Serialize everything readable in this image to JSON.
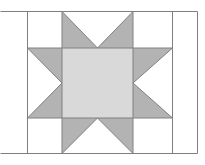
{
  "figure": {
    "canvas": {
      "width": 205,
      "height": 165
    },
    "background_color": "#ffffff"
  },
  "palette": {
    "background_fabric": "#ffffff",
    "star_point_fabric": "#b3b3b3",
    "center_fabric": "#d9d9d9",
    "seam_line": "#808080",
    "outer_frame_line": "#7f7f7f"
  },
  "frame": {
    "name": "block-outer-frame",
    "left": 0.5,
    "top": 11.5,
    "right": 197.5,
    "bottom": 153.5,
    "stroke_width": 1
  },
  "sashing": {
    "name": "vertical-sashing-strips",
    "left_strip_x": 27.5,
    "right_strip_x": 172.5,
    "stroke_width": 1
  },
  "star": {
    "name": "sawtooth-star",
    "bounds": {
      "x0": 27.5,
      "y0": 11.5,
      "x1": 172.5,
      "y1": 153.5
    },
    "grid_x": [
      27.5,
      62.0,
      133.0,
      172.5
    ],
    "grid_y": [
      11.5,
      48.0,
      118.0,
      153.5
    ],
    "center_square": {
      "x0": 62.0,
      "y0": 48.0,
      "x1": 133.0,
      "y1": 118.0
    },
    "point_count": 8
  },
  "shapes": {
    "center_square": {
      "label": "center-square",
      "points": "62,48 133,48 133,118 62,118",
      "fill_key": "center_fabric"
    },
    "top_point_left": {
      "label": "top-star-point-left",
      "points": "62,11.5 97.5,118 62,48",
      "fill_key": "star_point_fabric"
    },
    "top_point_right": {
      "label": "top-star-point-right",
      "points": "133,11.5 133,48 97.5,118",
      "fill_key": "star_point_fabric"
    },
    "top_band_left": {
      "label": "top-band-left-triangle",
      "points": "62,11.5 97.5,48 62,48",
      "fill_key": "star_point_fabric"
    },
    "top_band_right": {
      "label": "top-band-right-triangle",
      "points": "133,11.5 133,48 97.5,48",
      "fill_key": "star_point_fabric"
    },
    "bottom_band_left": {
      "label": "bottom-band-left-triangle",
      "points": "62,153.5 62,118 97.5,118",
      "fill_key": "star_point_fabric"
    },
    "bottom_band_right": {
      "label": "bottom-band-right-triangle",
      "points": "133,153.5 97.5,118 133,118",
      "fill_key": "star_point_fabric"
    },
    "left_band_top": {
      "label": "left-band-top-triangle",
      "points": "27.5,48 62,48 62,83",
      "fill_key": "star_point_fabric"
    },
    "left_band_bottom": {
      "label": "left-band-bottom-triangle",
      "points": "27.5,118 62,83 62,118",
      "fill_key": "star_point_fabric"
    },
    "right_band_top": {
      "label": "right-band-top-triangle",
      "points": "172.5,48 133,83 133,48",
      "fill_key": "star_point_fabric"
    },
    "right_band_bottom": {
      "label": "right-band-bottom-triangle",
      "points": "172.5,118 133,118 133,83",
      "fill_key": "star_point_fabric"
    }
  },
  "seams": {
    "label": "seam-lines",
    "lines": [
      "M62,11.5 L97.5,48 L133,11.5",
      "M62,153.5 L97.5,118 L133,153.5",
      "M27.5,48 L62,83 L27.5,118",
      "M172.5,48 L133,83 L172.5,118",
      "M62,11.5 L62,153.5",
      "M133,11.5 L133,153.5",
      "M27.5,48 L172.5,48",
      "M27.5,118 L172.5,118"
    ]
  }
}
